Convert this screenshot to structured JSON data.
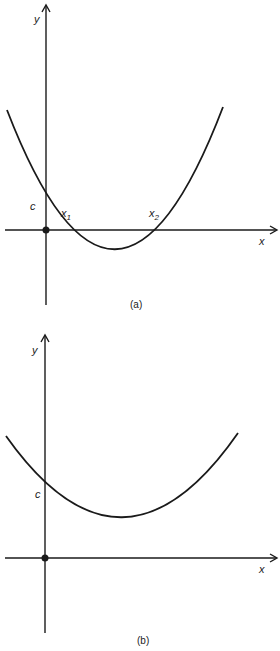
{
  "figures": [
    {
      "id": "a",
      "caption": "(a)",
      "axis_x_label": "x",
      "axis_y_label": "y",
      "intercept_label": "c",
      "root_labels": [
        {
          "base": "x",
          "sub": "1"
        },
        {
          "base": "x",
          "sub": "2"
        }
      ],
      "description": "Upward parabola crossing the x-axis at x1 and x2, y-intercept c"
    },
    {
      "id": "b",
      "caption": "(b)",
      "axis_x_label": "x",
      "axis_y_label": "y",
      "intercept_label": "c",
      "description": "Upward parabola entirely above the x-axis, y-intercept c, no real roots"
    }
  ],
  "colors": {
    "stroke": "#1a1a1a",
    "background": "#ffffff"
  }
}
